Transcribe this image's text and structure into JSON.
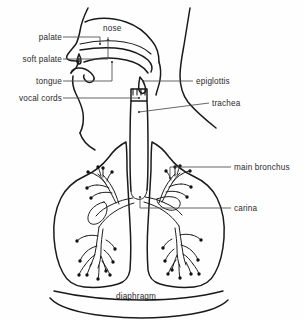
{
  "figure": {
    "background_color": "#fefefe",
    "ink_color": "#1a1a1a",
    "leader_color": "#4a4a4a"
  },
  "labels": {
    "palate": "palate",
    "soft_palate": "soft palate",
    "tongue": "tongue",
    "vocal_cords": "vocal cords",
    "nose": "nose",
    "epiglottis": "epiglottis",
    "trachea": "trachea",
    "main_bronchus": "main bronchus",
    "carina": "carina",
    "diaphragm": "diaphragm"
  },
  "label_list": [
    {
      "key": "palate",
      "text": "palate",
      "side": "left",
      "x": 60,
      "y": 40
    },
    {
      "key": "soft_palate",
      "text": "soft palate",
      "side": "left",
      "x": 60,
      "y": 62
    },
    {
      "key": "tongue",
      "text": "tongue",
      "side": "left",
      "x": 60,
      "y": 84
    },
    {
      "key": "vocal_cords",
      "text": "vocal cords",
      "side": "left",
      "x": 60,
      "y": 100
    },
    {
      "key": "nose",
      "text": "nose",
      "side": "inline",
      "x": 104,
      "y": 31
    },
    {
      "key": "epiglottis",
      "text": "epiglottis",
      "side": "right",
      "x": 196,
      "y": 84
    },
    {
      "key": "trachea",
      "text": "trachea",
      "side": "right",
      "x": 212,
      "y": 106
    },
    {
      "key": "main_bronchus",
      "text": "main bronchus",
      "side": "right",
      "x": 234,
      "y": 170
    },
    {
      "key": "carina",
      "text": "carina",
      "side": "right",
      "x": 234,
      "y": 211
    },
    {
      "key": "diaphragm",
      "text": "diaphragm",
      "side": "bottom",
      "x": 136,
      "y": 299
    }
  ]
}
